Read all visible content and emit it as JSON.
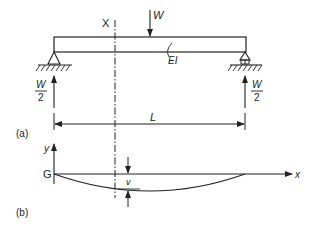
{
  "figure": {
    "part_a": {
      "label": "(a)",
      "section_label": "X",
      "load_label": "W",
      "stiffness_label": "EI",
      "reaction_left": {
        "numerator": "W",
        "denominator": "2"
      },
      "reaction_right": {
        "numerator": "W",
        "denominator": "2"
      },
      "span_label": "L"
    },
    "part_b": {
      "label": "(b)",
      "origin_label": "G",
      "y_axis_label": "y",
      "x_axis_label": "x",
      "deflection_label": "v"
    }
  }
}
